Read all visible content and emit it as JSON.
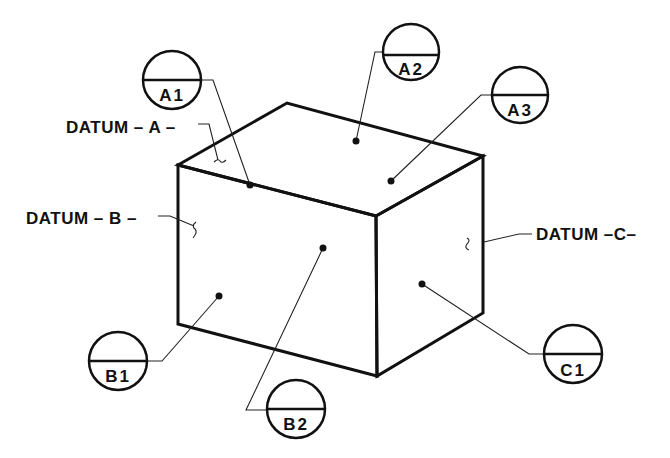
{
  "diagram": {
    "type": "isometric datum reference block",
    "colors": {
      "line": "#111111",
      "background": "#ffffff"
    },
    "box": {
      "vertices": {
        "top_left": [
          178,
          165
        ],
        "top_back": [
          287,
          103
        ],
        "top_right": [
          483,
          156
        ],
        "front_top_corner": [
          376,
          216
        ],
        "front_bottom_corner": [
          377,
          376
        ],
        "bottom_left": [
          178,
          324
        ],
        "bottom_right": [
          483,
          313
        ]
      }
    },
    "datums": [
      {
        "id": "A",
        "label": "DATUM – A –",
        "face": "top"
      },
      {
        "id": "B",
        "label": "DATUM – B –",
        "face": "front-left"
      },
      {
        "id": "C",
        "label": "DATUM –C–",
        "face": "right"
      }
    ],
    "targets": [
      {
        "id": "A1",
        "label": "A1",
        "circle": [
          172,
          80
        ],
        "dot": [
          250,
          185
        ]
      },
      {
        "id": "A2",
        "label": "A2",
        "circle": [
          411,
          52
        ],
        "dot": [
          356,
          141
        ]
      },
      {
        "id": "A3",
        "label": "A3",
        "circle": [
          520,
          95
        ],
        "dot": [
          391,
          181
        ]
      },
      {
        "id": "B1",
        "label": "B1",
        "circle": [
          118,
          361
        ],
        "dot": [
          219,
          296
        ]
      },
      {
        "id": "B2",
        "label": "B2",
        "circle": [
          296,
          410
        ],
        "dot": [
          323,
          248
        ]
      },
      {
        "id": "C1",
        "label": "C1",
        "circle": [
          573,
          361
        ],
        "dot": [
          422,
          284
        ]
      }
    ]
  },
  "labels": {
    "datum_a": "DATUM – A –",
    "datum_b": "DATUM – B –",
    "datum_c": "DATUM –C–",
    "a1": "A1",
    "a2": "A2",
    "a3": "A3",
    "b1": "B1",
    "b2": "B2",
    "c1": "C1"
  }
}
